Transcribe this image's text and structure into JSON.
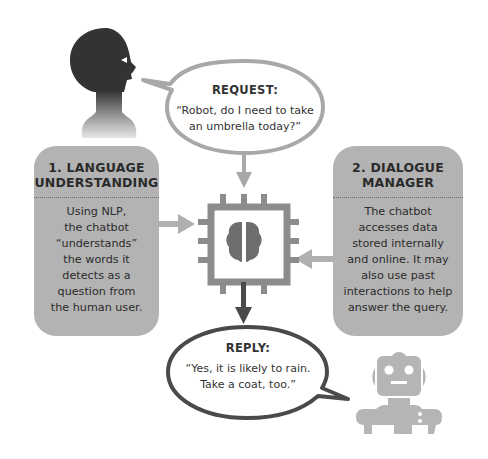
{
  "request_bubble": {
    "title": "REQUEST:",
    "line1": "“Robot, do I need to take",
    "line2": "an umbrella today?”"
  },
  "reply_bubble": {
    "title": "REPLY:",
    "line1": "“Yes, it is likely to rain.",
    "line2": "Take a coat, too.”"
  },
  "language_box": {
    "title_line1": "1. LANGUAGE",
    "title_line2": "UNDERSTANDING",
    "body": [
      "Using NLP,",
      "the chatbot",
      "“understands”",
      "the words it",
      "detects as a",
      "question from",
      "the human user."
    ]
  },
  "dialogue_box": {
    "title_line1": "2. DIALOGUE",
    "title_line2": "MANAGER",
    "body": [
      "The chatbot",
      "accesses data",
      "stored internally",
      "and online. It may",
      "also use past",
      "interactions to help",
      "answer the query."
    ]
  },
  "icons": {
    "human": "human-head-icon",
    "chip": "chip-brain-icon",
    "robot": "robot-icon"
  },
  "colors": {
    "box_fill": "#b3b3b3",
    "light_arrow": "#b0b0b0",
    "chip": "#8c8c8c",
    "brain": "#6e6e6e",
    "dark_arrow": "#4a4a4a",
    "head": "#333333",
    "robot": "#b5b5b5",
    "text": "#2b2b2b"
  }
}
